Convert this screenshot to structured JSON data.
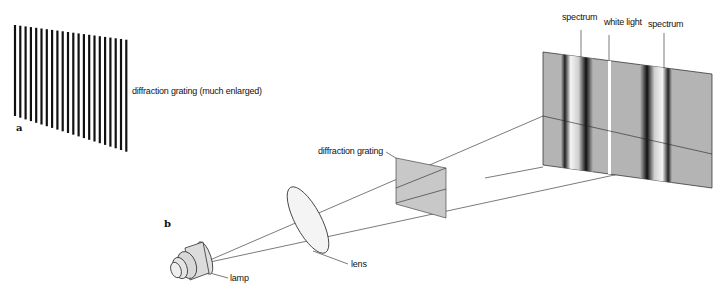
{
  "panel_a": {
    "letter": "a",
    "label": "diffraction grating (much enlarged)"
  },
  "panel_b": {
    "letter": "b",
    "labels": {
      "lamp": "lamp",
      "lens": "lens",
      "grating": "diffraction grating",
      "spectrum_left": "spectrum",
      "white_light": "white light",
      "spectrum_right": "spectrum"
    }
  },
  "colors": {
    "ink": "#111111",
    "grating_fill": "#c8c8c8",
    "screen_fill": "#b4b4b4",
    "lamp_fill": "#dcdcdc"
  }
}
